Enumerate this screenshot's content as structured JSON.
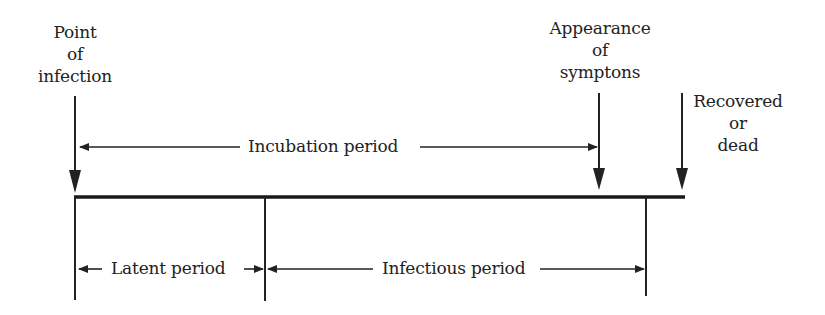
{
  "diagram": {
    "type": "timeline",
    "colors": {
      "ink": "#222222",
      "background": "#ffffff"
    },
    "events": [
      {
        "id": "infection",
        "lines": [
          "Point",
          "of",
          "infection"
        ]
      },
      {
        "id": "symptoms",
        "lines": [
          "Appearance",
          "of",
          "symptons"
        ]
      },
      {
        "id": "outcome",
        "lines": [
          "Recovered",
          "or",
          "dead"
        ]
      }
    ],
    "periods": {
      "incubation": "Incubation period",
      "latent": "Latent period",
      "infectious": "Infectious period"
    }
  }
}
